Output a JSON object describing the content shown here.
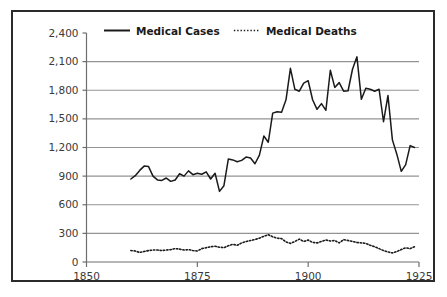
{
  "chart_data": {
    "type": "line",
    "title": "",
    "subtitle": "",
    "xlabel": "",
    "ylabel": "",
    "xlim": [
      1850,
      1925
    ],
    "ylim": [
      0,
      2400
    ],
    "grid": true,
    "legend_position": "top-center",
    "x_ticks": [
      "1850",
      "1875",
      "1900",
      "1925"
    ],
    "x_tick_values": [
      1850,
      1875,
      1900,
      1925
    ],
    "y_ticks": [
      "0",
      "300",
      "600",
      "900",
      "1,200",
      "1,500",
      "1,800",
      "2,100",
      "2,400"
    ],
    "y_tick_values": [
      0,
      300,
      600,
      900,
      1200,
      1500,
      1800,
      2100,
      2400
    ],
    "series": [
      {
        "name": "Medical Cases",
        "style": "solid",
        "color": "#1a1a1a",
        "x": [
          1860,
          1861,
          1862,
          1863,
          1864,
          1865,
          1866,
          1867,
          1868,
          1869,
          1870,
          1871,
          1872,
          1873,
          1874,
          1875,
          1876,
          1877,
          1878,
          1879,
          1880,
          1881,
          1882,
          1883,
          1884,
          1885,
          1886,
          1887,
          1888,
          1889,
          1890,
          1891,
          1892,
          1893,
          1894,
          1895,
          1896,
          1897,
          1898,
          1899,
          1900,
          1901,
          1902,
          1903,
          1904,
          1905,
          1906,
          1907,
          1908,
          1909,
          1910,
          1911,
          1912,
          1913,
          1914,
          1915,
          1916,
          1917,
          1918,
          1919,
          1920,
          1921,
          1922,
          1923,
          1924
        ],
        "values": [
          870,
          905,
          960,
          1005,
          1000,
          900,
          860,
          855,
          880,
          845,
          860,
          925,
          900,
          955,
          915,
          930,
          920,
          945,
          870,
          930,
          740,
          800,
          1080,
          1070,
          1050,
          1065,
          1100,
          1090,
          1030,
          1120,
          1320,
          1255,
          1560,
          1575,
          1570,
          1700,
          2030,
          1810,
          1790,
          1875,
          1900,
          1700,
          1600,
          1660,
          1590,
          2010,
          1830,
          1880,
          1790,
          1795,
          2020,
          2150,
          1705,
          1820,
          1810,
          1790,
          1810,
          1470,
          1745,
          1280,
          1130,
          950,
          1020,
          1220,
          1200
        ],
        "y_end_value": 1255
      },
      {
        "name": "Medical Deaths",
        "style": "dotted",
        "color": "#1a1a1a",
        "x": [
          1860,
          1861,
          1862,
          1863,
          1864,
          1865,
          1866,
          1867,
          1868,
          1869,
          1870,
          1871,
          1872,
          1873,
          1874,
          1875,
          1876,
          1877,
          1878,
          1879,
          1880,
          1881,
          1882,
          1883,
          1884,
          1885,
          1886,
          1887,
          1888,
          1889,
          1890,
          1891,
          1892,
          1893,
          1894,
          1895,
          1896,
          1897,
          1898,
          1899,
          1900,
          1901,
          1902,
          1903,
          1904,
          1905,
          1906,
          1907,
          1908,
          1909,
          1910,
          1911,
          1912,
          1913,
          1914,
          1915,
          1916,
          1917,
          1918,
          1919,
          1920,
          1921,
          1922,
          1923,
          1924
        ],
        "values": [
          120,
          115,
          100,
          110,
          120,
          125,
          125,
          120,
          125,
          130,
          140,
          135,
          125,
          130,
          120,
          115,
          140,
          150,
          160,
          165,
          155,
          150,
          170,
          185,
          175,
          200,
          215,
          225,
          235,
          250,
          270,
          285,
          265,
          250,
          245,
          210,
          195,
          215,
          240,
          215,
          230,
          205,
          200,
          215,
          230,
          220,
          225,
          200,
          235,
          225,
          215,
          205,
          200,
          195,
          175,
          160,
          140,
          120,
          105,
          95,
          110,
          130,
          150,
          140,
          160
        ]
      }
    ]
  },
  "legend": {
    "items": [
      {
        "label": "Medical Cases",
        "style": "solid"
      },
      {
        "label": "Medical Deaths",
        "style": "dotted"
      }
    ]
  },
  "colors": {
    "line": "#1a1a1a",
    "grid": "#949494",
    "axis": "#6e6e6e",
    "tick_text": "#3a3a3a",
    "frame": "#2b2b2b",
    "background": "#ffffff"
  }
}
